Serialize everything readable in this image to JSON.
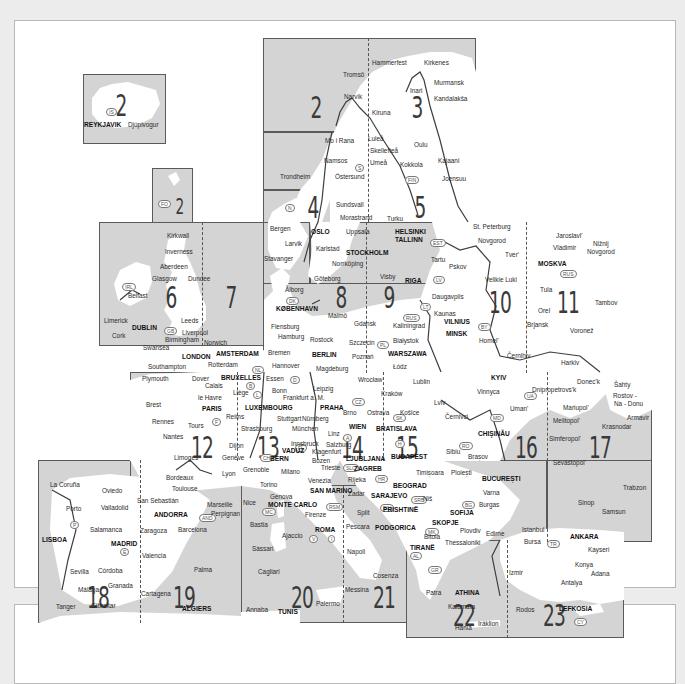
{
  "map": {
    "title": "Europe map sheet index",
    "colors": {
      "sea": "#d4d4d4",
      "land": "#ffffff",
      "border": "#5a5a5a",
      "background": "#ececec"
    },
    "insets": [
      {
        "sheet": "2",
        "name": "Iceland",
        "badge": "IS",
        "cities": [
          "REYKJAVIK",
          "Djúpivogur"
        ]
      },
      {
        "sheet": "2",
        "name": "Faroe Islands",
        "badge": "FO",
        "cities": [
          "Tórshavn"
        ]
      }
    ],
    "sheets": [
      {
        "number": "2",
        "cities": [
          "Tromsö",
          "Narvik",
          "Mo i Rana",
          "Namsos",
          "Trondheim",
          "Östersund"
        ]
      },
      {
        "number": "3",
        "cities": [
          "Hammerfest",
          "Kirkenes",
          "Murmansk",
          "Inari",
          "Kandalakša",
          "Kiruna",
          "Luleå",
          "Oulu",
          "Skellefteå",
          "Kokkola",
          "Kajaani",
          "Umeå",
          "Joensuu"
        ]
      },
      {
        "number": "4",
        "cities": [
          "Sundsvall",
          "Morastrand"
        ]
      },
      {
        "number": "5",
        "cities": [
          "Turku",
          "HELSINKI",
          "TALLINN"
        ]
      },
      {
        "number": "6",
        "cities": [
          "Kirkwall",
          "Inverness",
          "Aberdeen",
          "Glasgow",
          "Dundee",
          "Belfast",
          "Limerick",
          "DUBLIN",
          "Cork",
          "Leeds",
          "Liverpool",
          "Birmingham",
          "Swansea",
          "LONDON",
          "Southampton"
        ]
      },
      {
        "number": "7",
        "cities": [
          "Norwich",
          "AMSTERDAM",
          "Rotterdam"
        ]
      },
      {
        "number": "8",
        "cities": [
          "Bergen",
          "Larvik",
          "Stavanger",
          "OSLO",
          "Karlstad",
          "Göteborg",
          "Ålborg",
          "KØBENHAVN",
          "Malmö",
          "Flensburg",
          "Hamburg",
          "Bremen",
          "Hannover",
          "Rostock",
          "BERLIN",
          "Magdeburg"
        ]
      },
      {
        "number": "9",
        "cities": [
          "Uppsala",
          "STOCKHOLM",
          "Norrköping",
          "Visby",
          "RIGA",
          "Gdansk",
          "Kaliningrad",
          "Szczecin",
          "Poznań",
          "Białystok",
          "WARSZAWA",
          "Łódz"
        ]
      },
      {
        "number": "10",
        "cities": [
          "St. Peterburg",
          "Novgorod",
          "Tver'",
          "Tartu",
          "Pskov",
          "Velikie Luki",
          "Daugavpils",
          "Kaunas",
          "VILNIUS",
          "MINSK",
          "Homel'",
          "Černihiv"
        ]
      },
      {
        "number": "11",
        "cities": [
          "Jaroslavl'",
          "Vladimir",
          "Nižnij Novgorod",
          "MOSKVA",
          "Tula",
          "Orel",
          "Tambov",
          "Brjansk",
          "Voronež",
          "Harkiv"
        ]
      },
      {
        "number": "12",
        "cities": [
          "Plymouth",
          "Brest",
          "le Havre",
          "PARIS",
          "Rennes",
          "Tours",
          "Nantes",
          "Limoges"
        ]
      },
      {
        "number": "13",
        "cities": [
          "Dover",
          "Calais",
          "BRUXELLES",
          "Liège",
          "LUXEMBOURG",
          "Reims",
          "Strasbourg",
          "Dijon",
          "Genève",
          "BERN",
          "VADUZ",
          "Essen",
          "Bonn",
          "Frankfurt a. M.",
          "Stuttgart",
          "Nürnberg",
          "München"
        ]
      },
      {
        "number": "14",
        "cities": [
          "Leipzig",
          "PRAHA",
          "Brno",
          "WIEN",
          "Linz",
          "Salzburg",
          "Innsbruck",
          "Klagenfurt",
          "Bozen",
          "LJUBLJANA",
          "Wrocław",
          "Kraków",
          "Ostrava"
        ]
      },
      {
        "number": "15",
        "cities": [
          "Lublin",
          "Lviv",
          "Košice",
          "BRATISLAVA",
          "BUDAPEST"
        ]
      },
      {
        "number": "16",
        "cities": [
          "KYIV",
          "Vinnyca",
          "Uman'",
          "Černivci",
          "CHIŞINĂU",
          "Sibiu",
          "Brașov",
          "Ploiești",
          "BUCUREȘTI"
        ]
      },
      {
        "number": "17",
        "cities": [
          "Dnipropetrovs'k",
          "Donec'k",
          "Šahty",
          "Rostov-Na-Donu",
          "Mariupol'",
          "Melitopol'",
          "Armavir",
          "Krasnodar",
          "Simferopol'",
          "Sevastopol'",
          "Trabzon",
          "Sinop",
          "Samsun"
        ]
      },
      {
        "number": "18",
        "cities": [
          "La Coruña",
          "Oviedo",
          "Porto",
          "Valladolid",
          "Salamanca",
          "LISBOA",
          "MADRID",
          "Sevilla",
          "Córdoba",
          "Málaga",
          "Granada",
          "Tanger",
          "Gibraltar"
        ]
      },
      {
        "number": "19",
        "cities": [
          "Bordeaux",
          "Toulouse",
          "San Sebastián",
          "ANDORRA",
          "Marseille",
          "Perpignan",
          "Lyon",
          "Zaragoza",
          "Barcelona",
          "Valencia",
          "Palma",
          "Cartagena",
          "ALGIERS"
        ]
      },
      {
        "number": "20",
        "cities": [
          "Grenoble",
          "Milano",
          "Torino",
          "Genova",
          "Nice",
          "MONTE CARLO",
          "Bastia",
          "Ajaccio",
          "ROMA",
          "Sàssari",
          "Cagliari",
          "Annaba",
          "TUNIS"
        ]
      },
      {
        "number": "21",
        "cities": [
          "Trieste",
          "ZAGREB",
          "Venezia",
          "SAN MARINO",
          "Firenze",
          "Rijeka",
          "Zadar",
          "Split",
          "SARAJEVO",
          "BEOGRAD",
          "Pescara",
          "PODGORICA",
          "Napoli",
          "Cosenza",
          "Messina",
          "Palermo"
        ]
      },
      {
        "number": "22",
        "cities": [
          "Timișoara",
          "Niš",
          "PRISHTINË",
          "SKOPJE",
          "SOFIJA",
          "TIRANË",
          "Bitola",
          "Thessaloniki",
          "Plovdiv",
          "Edirne",
          "Patra",
          "ATHINA",
          "Kalamata",
          "Hania",
          "Iráklion",
          "Varna",
          "Burgas"
        ]
      },
      {
        "number": "23",
        "cities": [
          "Istanbul",
          "Bursa",
          "ANKARA",
          "Kayseri",
          "Konya",
          "Adana",
          "Izmir",
          "Antalya",
          "Rodos",
          "LEFKOSIA"
        ]
      }
    ],
    "labels": {
      "s2": "2",
      "s2b": "2",
      "s2c": "2",
      "s3": "3",
      "s4": "4",
      "s5": "5",
      "s6": "6",
      "s7": "7",
      "s8": "8",
      "s9": "9",
      "s10": "10",
      "s11": "11",
      "s12": "12",
      "s13": "13",
      "s14": "14",
      "s15": "15",
      "s16": "16",
      "s17": "17",
      "s18": "18",
      "s19": "19",
      "s20": "20",
      "s21": "21",
      "s22": "22",
      "s23": "23"
    },
    "badges": {
      "IS": "IS",
      "FO": "FO",
      "N": "N",
      "S": "S",
      "FIN": "FIN",
      "EST": "EST",
      "LV": "LV",
      "LT": "LT",
      "RUS": "RUS",
      "BY": "BY",
      "IRL": "IRL",
      "GB": "GB",
      "DK": "DK",
      "PL": "PL",
      "NL": "NL",
      "B": "B",
      "L": "L",
      "D": "D",
      "F": "F",
      "CZ": "CZ",
      "SK": "SK",
      "A": "A",
      "H": "H",
      "CH": "CH",
      "FL": "FL",
      "SLO": "SLO",
      "HR": "HR",
      "BIH": "BIH",
      "SRB": "SRB",
      "UA": "UA",
      "MD": "MD",
      "RO": "RO",
      "BG": "BG",
      "MK": "MK",
      "AL": "AL",
      "GR": "GR",
      "TR": "TR",
      "CY": "CY",
      "P": "P",
      "E": "E",
      "I": "I",
      "V": "V",
      "MC": "MC",
      "AND": "AND",
      "RSM": "RSM",
      "MNE": "MNE",
      "KOS": "KOS"
    },
    "cities": {
      "reykjavik": "REYKJAVIK",
      "djupivogur": "Djúpivogur",
      "torshavn": "Tórshavn",
      "hammerfest": "Hammerfest",
      "kirkenes": "Kirkenes",
      "tromso": "Tromsö",
      "murmansk": "Murmansk",
      "inari": "Inari",
      "narvik": "Narvik",
      "kandalaksa": "Kandalakša",
      "kiruna": "Kiruna",
      "moirana": "Mo i Rana",
      "lulea": "Luleå",
      "oulu": "Oulu",
      "skelleftea": "Skellefteå",
      "namsos": "Namsos",
      "umea": "Umeå",
      "kokkola": "Kokkola",
      "kajaani": "Kajaani",
      "trondheim": "Trondheim",
      "ostersund": "Östersund",
      "joensuu": "Joensuu",
      "sundsvall": "Sundsvall",
      "morastrand": "Morastrand",
      "turku": "Turku",
      "helsinki": "HELSINKI",
      "tallinn": "TALLINN",
      "bergen": "Bergen",
      "oslo": "OSLO",
      "uppsala": "Uppsala",
      "larvik": "Larvik",
      "karlstad": "Karlstad",
      "stavanger": "Stavanger",
      "stockholm": "STOCKHOLM",
      "norrkoping": "Norrköping",
      "goteborg": "Göteborg",
      "visby": "Visby",
      "riga": "RIGA",
      "stpeterburg": "St. Peterburg",
      "novgorod": "Novgorod",
      "tver": "Tver'",
      "tartu": "Tartu",
      "pskov": "Pskov",
      "velikieluki": "Velikie Luki",
      "jaroslavl": "Jaroslavl'",
      "vladimir": "Vladimir",
      "niznij": "Nižnij",
      "novgorod2": "Novgorod",
      "moskva": "MOSKVA",
      "tula": "Tula",
      "orel": "Orel",
      "tambov": "Tambov",
      "brjansk": "Brjansk",
      "voronez": "Voronež",
      "harkiv": "Harkiv",
      "kirkwall": "Kirkwall",
      "inverness": "Inverness",
      "aberdeen": "Aberdeen",
      "glasgow": "Glasgow",
      "dundee": "Dundee",
      "belfast": "Belfast",
      "limerick": "Limerick",
      "dublin": "DUBLIN",
      "cork": "Cork",
      "leeds": "Leeds",
      "liverpool": "Liverpool",
      "birmingham": "Birmingham",
      "norwich": "Norwich",
      "swansea": "Swansea",
      "london": "LONDON",
      "amsterdam": "AMSTERDAM",
      "southampton": "Southampton",
      "rotterdam": "Rotterdam",
      "alborg": "Ålborg",
      "kobenhavn": "KØBENHAVN",
      "malmo": "Malmö",
      "flensburg": "Flensburg",
      "gdansk": "Gdansk",
      "kaliningrad": "Kaliningrad",
      "hamburg": "Hamburg",
      "rostock": "Rostock",
      "szczecin": "Szczecin",
      "bialystok": "Białystok",
      "bremen": "Bremen",
      "berlin": "BERLIN",
      "poznan": "Poznań",
      "warszawa": "WARSZAWA",
      "hannover": "Hannover",
      "magdeburg": "Magdeburg",
      "lodz": "Łódz",
      "daugavpils": "Daugavpils",
      "kaunas": "Kaunas",
      "vilnius": "VILNIUS",
      "minsk": "MINSK",
      "homel": "Homel'",
      "cernihiv": "Černihiv",
      "plymouth": "Plymouth",
      "dover": "Dover",
      "bruxelles": "BRUXELLES",
      "essen": "Essen",
      "calais": "Calais",
      "liege": "Liège",
      "bonn": "Bonn",
      "lehavre": "le Havre",
      "frankfurt": "Frankfurt a. M.",
      "brest": "Brest",
      "paris": "PARIS",
      "luxembourg": "LUXEMBOURG",
      "reims": "Reims",
      "rennes": "Rennes",
      "tours": "Tours",
      "stuttgart": "Stuttgart",
      "nurnberg": "Nürnberg",
      "strasbourg": "Strasbourg",
      "munchen": "München",
      "nantes": "Nantes",
      "dijon": "Dijon",
      "limoges": "Limoges",
      "geneve": "Genève",
      "bern": "BERN",
      "vaduz": "VADUZ",
      "leipzig": "Leipzig",
      "praha": "PRAHA",
      "wroclaw": "Wrocław",
      "lublin": "Lublin",
      "krakow": "Kraków",
      "lviv": "Lviv",
      "brno": "Brno",
      "ostrava": "Ostrava",
      "kosice": "Košice",
      "wien": "WIEN",
      "bratislava": "BRATISLAVA",
      "linz": "Linz",
      "salzburg": "Salzburg",
      "innsbruck": "Innsbruck",
      "klagenfurt": "Klagenfurt",
      "bozen": "Bozen",
      "ljubljana": "LJUBLJANA",
      "budapest": "BUDAPEST",
      "kyiv": "KYIV",
      "vinnyca": "Vinnyca",
      "dnipro": "Dnipropetrovs'k",
      "doneck": "Donec'k",
      "sahty": "Šahty",
      "uman": "Uman'",
      "mariupol": "Mariupol'",
      "rostov": "Rostov -",
      "rostov2": "Na - Donu",
      "cernivci": "Černivci",
      "melitopol": "Melitopol'",
      "armavir": "Armavir",
      "krasnodar": "Krasnodar",
      "chisinau": "CHIŞINĂU",
      "simferopol": "Simferopol'",
      "sevastopol": "Sevastopol'",
      "sibiu": "Sibiu",
      "brasov": "Brașov",
      "ploiesti": "Ploiești",
      "bucuresti": "BUCUREȘTI",
      "trabzon": "Trabzon",
      "sinop": "Sinop",
      "samsun": "Samsun",
      "bordeaux": "Bordeaux",
      "lyon": "Lyon",
      "grenoble": "Grenoble",
      "milano": "Milano",
      "trieste": "Trieste",
      "zagreb": "ZAGREB",
      "timisoara": "Timișoara",
      "toulouse": "Toulouse",
      "torino": "Torino",
      "venezia": "Venezia",
      "rijeka": "Rijeka",
      "beograd": "BEOGRAD",
      "sansebastian": "San Sebastián",
      "marseille": "Marseille",
      "genova": "Genova",
      "sanmarino": "SAN MARINO",
      "zadar": "Zadar",
      "sarajevo": "SARAJEVO",
      "nis": "Niš",
      "varna": "Varna",
      "andorra": "ANDORRA",
      "perpignan": "Perpignan",
      "nice": "Nice",
      "montecarlo": "MONTE CARLO",
      "split": "Split",
      "prishtine": "PRISHTINË",
      "sofija": "SOFIJA",
      "burgas": "Burgas",
      "firenze": "Firenze",
      "lacoruna": "La Coruña",
      "oviedo": "Oviedo",
      "porto": "Porto",
      "valladolid": "Valladolid",
      "salamanca": "Salamanca",
      "zaragoza": "Zaragoza",
      "barcelona": "Barcelona",
      "lisboa": "LISBOA",
      "madrid": "MADRID",
      "valencia": "Valencia",
      "palma": "Palma",
      "sevilla": "Sevilla",
      "cordoba": "Córdoba",
      "granada": "Granada",
      "malaga": "Málaga",
      "cartagena": "Cartagena",
      "tanger": "Tanger",
      "gibraltar": "Gibraltar",
      "algiers": "ALGIERS",
      "bastia": "Bastia",
      "ajaccio": "Ajaccio",
      "roma": "ROMA",
      "sassari": "Sàssari",
      "cagliari": "Cagliari",
      "annaba": "Annaba",
      "tunis": "TUNIS",
      "pescara": "Pescara",
      "podgorica": "PODGORICA",
      "napoli": "Napoli",
      "cosenza": "Cosenza",
      "messina": "Messina",
      "palermo": "Palermo",
      "skopje": "SKOPJE",
      "bitola": "Bitola",
      "tirane": "TIRANË",
      "thessaloniki": "Thessaloniki",
      "plovdiv": "Plovdiv",
      "edirne": "Edirne",
      "istanbul": "Istanbul",
      "bursa": "Bursa",
      "ankara": "ANKARA",
      "kayseri": "Kayseri",
      "konya": "Konya",
      "adana": "Adana",
      "izmir": "Izmir",
      "antalya": "Antalya",
      "patra": "Patra",
      "athina": "ATHINA",
      "kalamata": "Kalamata",
      "rodos": "Rodos",
      "lefkosia": "LEFKOSIA",
      "hania": "Hania",
      "iraklion": "Iráklion"
    }
  }
}
